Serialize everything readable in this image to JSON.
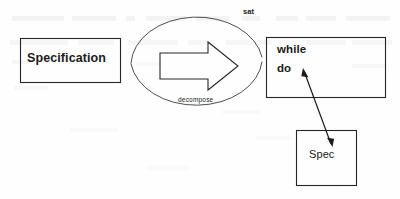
{
  "diagram": {
    "ink_color": "#1b1b1b",
    "background_color": "#fefefe",
    "nodes": [
      {
        "id": "specification",
        "label": "Specification",
        "shape": "rectangle",
        "bold": true
      },
      {
        "id": "while-do",
        "label_line1": "while",
        "label_line2": "do",
        "shape": "rectangle",
        "bold": true
      },
      {
        "id": "spec",
        "label": "Spec",
        "shape": "rectangle",
        "bold": false
      }
    ],
    "edges": [
      {
        "id": "transform-arrow",
        "kind": "block-arrow",
        "direction": "left-to-right",
        "from": "specification",
        "to": "while-do"
      },
      {
        "id": "refinement-arrow",
        "kind": "double-headed-line",
        "from": "while-do.do",
        "to": "spec"
      }
    ],
    "annotations": [
      {
        "id": "sat",
        "text": "sat",
        "position": "above-ellipse-right",
        "bold": true
      },
      {
        "id": "decompose",
        "text": "decompose",
        "position": "inside-ellipse-bottom",
        "bold": false
      }
    ],
    "ellipse": {
      "id": "decomposition-ellipse",
      "style": "open-arc-pair",
      "encloses": "transform-arrow"
    }
  }
}
